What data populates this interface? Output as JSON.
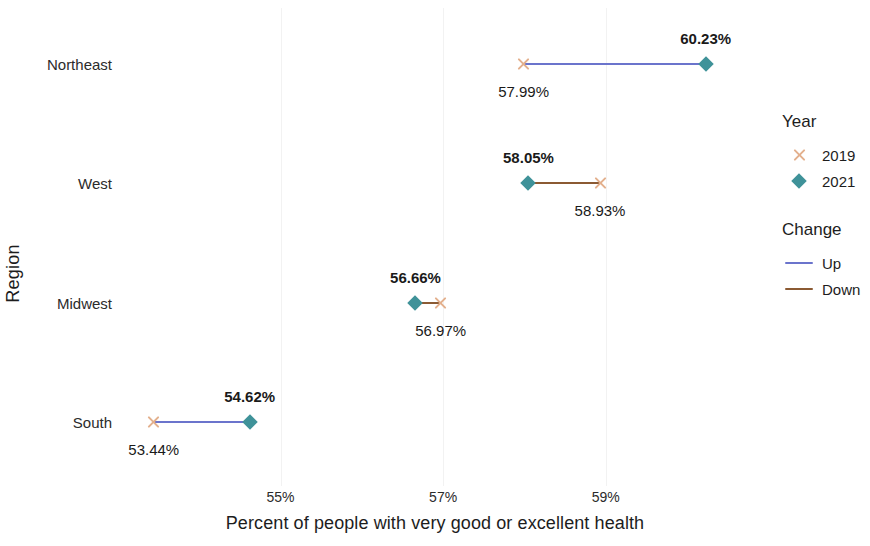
{
  "chart_data": {
    "type": "scatter",
    "subtype": "dumbbell",
    "title": "",
    "xlabel": "Percent of people with very good or excellent health",
    "ylabel": "Region",
    "categories": [
      "Northeast",
      "West",
      "Midwest",
      "South"
    ],
    "xlim": [
      53.0,
      60.8
    ],
    "xticks": [
      55,
      57,
      59
    ],
    "xticklabels": [
      "55%",
      "57%",
      "59%"
    ],
    "grid": true,
    "legend_position": "right",
    "series": [
      {
        "name": "2019",
        "values": [
          57.99,
          58.93,
          56.97,
          53.44
        ]
      },
      {
        "name": "2021",
        "values": [
          60.23,
          58.05,
          56.66,
          54.62
        ]
      }
    ],
    "points": [
      {
        "region": "Northeast",
        "value_2019": 57.99,
        "value_2021": 60.23,
        "label_2019": "57.99%",
        "label_2021": "60.23%",
        "change": "Up"
      },
      {
        "region": "West",
        "value_2019": 58.93,
        "value_2021": 58.05,
        "label_2019": "58.93%",
        "label_2021": "58.05%",
        "change": "Down"
      },
      {
        "region": "Midwest",
        "value_2019": 56.97,
        "value_2021": 56.66,
        "label_2019": "56.97%",
        "label_2021": "56.66%",
        "change": "Down"
      },
      {
        "region": "South",
        "value_2019": 53.44,
        "value_2021": 54.62,
        "label_2019": "53.44%",
        "label_2021": "54.62%",
        "change": "Up"
      }
    ]
  },
  "axes": {
    "y_title": "Region",
    "x_title": "Percent of people with very good or excellent health"
  },
  "legend": {
    "year": {
      "title": "Year",
      "items": [
        {
          "label": "2019",
          "marker": "x-marker-icon",
          "color": "#e3b08d"
        },
        {
          "label": "2021",
          "marker": "diamond-marker-icon",
          "color": "#3f9299"
        }
      ]
    },
    "change": {
      "title": "Change",
      "items": [
        {
          "label": "Up",
          "marker": "line-swatch-icon",
          "color": "#6b74cc"
        },
        {
          "label": "Down",
          "marker": "line-swatch-icon",
          "color": "#8b5a33"
        }
      ]
    }
  },
  "colors": {
    "year_2019": "#e3b08d",
    "year_2021": "#3f9299",
    "change_up": "#6b74cc",
    "change_down": "#8b5a33",
    "gridline": "#f2f2f2",
    "text": "#1d1d1d",
    "background": "#ffffff"
  }
}
